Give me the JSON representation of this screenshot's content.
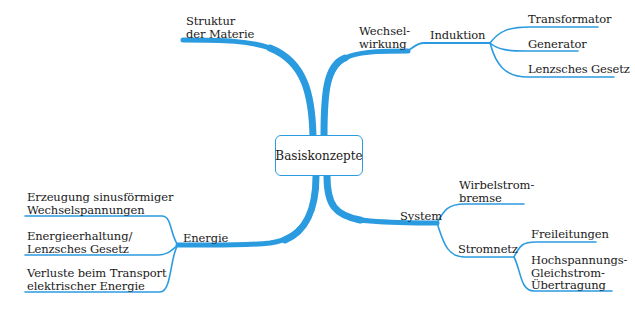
{
  "diagram": {
    "type": "mind-map",
    "line_color": "#2b9be0",
    "center": {
      "label": "Basiskonzepte"
    },
    "branches": [
      {
        "label_lines": [
          "Struktur",
          "der Materie"
        ],
        "children": []
      },
      {
        "label_lines": [
          "Wechsel-",
          "wirkung"
        ],
        "children": [
          {
            "label": "Induktion",
            "children": [
              {
                "label": "Transformator"
              },
              {
                "label": "Generator"
              },
              {
                "label": "Lenzsches Gesetz"
              }
            ]
          }
        ]
      },
      {
        "label": "Energie",
        "children": [
          {
            "label_lines": [
              "Erzeugung sinusförmiger",
              "Wechselspannungen"
            ]
          },
          {
            "label_lines": [
              "Energieerhaltung/",
              "Lenzsches Gesetz"
            ]
          },
          {
            "label_lines": [
              "Verluste beim Transport",
              "elektrischer Energie"
            ]
          }
        ]
      },
      {
        "label": "System",
        "children": [
          {
            "label_lines": [
              "Wirbelstrom-",
              "bremse"
            ]
          },
          {
            "label": "Stromnetz",
            "children": [
              {
                "label": "Freileitungen"
              },
              {
                "label_lines": [
                  "Hochspannungs-",
                  "Gleichstrom-",
                  "Übertragung"
                ]
              }
            ]
          }
        ]
      }
    ]
  }
}
